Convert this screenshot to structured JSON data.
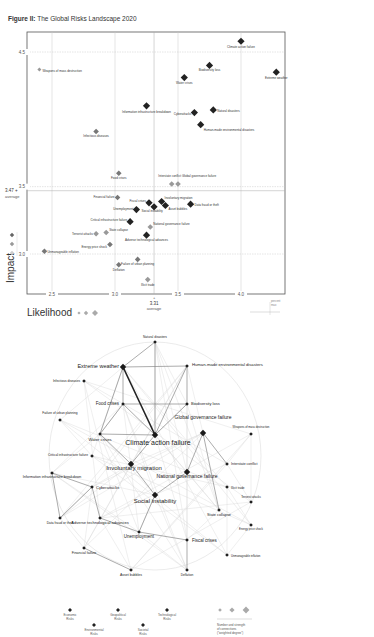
{
  "figure_title_prefix": "Figure II:",
  "figure_title": "The Global Risks Landscape 2020",
  "chart_data": [
    {
      "type": "scatter",
      "title": "The Global Risks Landscape 2020",
      "xlabel": "Likelihood",
      "ylabel": "Impact",
      "xlim": [
        2.3,
        4.3
      ],
      "ylim": [
        2.7,
        4.7
      ],
      "xticks": [
        "2.5",
        "3.0",
        "3.5",
        "4.0"
      ],
      "yticks": [
        "3.0",
        "3.5",
        "4.5"
      ],
      "x_average": {
        "value": 3.31,
        "label": "3.31",
        "caption": "average"
      },
      "y_average": {
        "value": 3.47,
        "label": "3.47",
        "caption": "average"
      },
      "grid": true,
      "points": [
        {
          "name": "Climate action failure",
          "x": 4.0,
          "y": 4.58,
          "category": "environmental",
          "size": 3
        },
        {
          "name": "Extreme weather",
          "x": 4.28,
          "y": 4.35,
          "category": "environmental",
          "size": 3
        },
        {
          "name": "Biodiversity loss",
          "x": 3.75,
          "y": 4.4,
          "category": "environmental",
          "size": 3
        },
        {
          "name": "Water crises",
          "x": 3.55,
          "y": 4.31,
          "category": "societal",
          "size": 3
        },
        {
          "name": "Weapons of mass destruction",
          "x": 2.4,
          "y": 4.37,
          "category": "geopolitical",
          "size": 1
        },
        {
          "name": "Information infrastructure breakdown",
          "x": 3.25,
          "y": 4.1,
          "category": "technological",
          "size": 3
        },
        {
          "name": "Natural disasters",
          "x": 3.78,
          "y": 4.07,
          "category": "environmental",
          "size": 3
        },
        {
          "name": "Cyberattacks",
          "x": 3.63,
          "y": 4.05,
          "category": "technological",
          "size": 3
        },
        {
          "name": "Human-made environmental disasters",
          "x": 3.68,
          "y": 3.96,
          "category": "environmental",
          "size": 3
        },
        {
          "name": "Infectious diseases",
          "x": 2.85,
          "y": 3.91,
          "category": "societal",
          "size": 2
        },
        {
          "name": "Food crises",
          "x": 3.03,
          "y": 3.6,
          "category": "societal",
          "size": 2
        },
        {
          "name": "Interstate conflict",
          "x": 3.45,
          "y": 3.52,
          "category": "geopolitical",
          "size": 2
        },
        {
          "name": "Global governance failure",
          "x": 3.5,
          "y": 3.52,
          "category": "geopolitical",
          "size": 2
        },
        {
          "name": "Financial failure",
          "x": 3.02,
          "y": 3.42,
          "category": "economic",
          "size": 2
        },
        {
          "name": "Fiscal crises",
          "x": 3.27,
          "y": 3.38,
          "category": "economic",
          "size": 3
        },
        {
          "name": "Involuntary migration",
          "x": 3.37,
          "y": 3.39,
          "category": "societal",
          "size": 3
        },
        {
          "name": "Asset bubbles",
          "x": 3.4,
          "y": 3.36,
          "category": "economic",
          "size": 3
        },
        {
          "name": "Data fraud or theft",
          "x": 3.6,
          "y": 3.37,
          "category": "technological",
          "size": 3
        },
        {
          "name": "Unemployment",
          "x": 3.17,
          "y": 3.33,
          "category": "economic",
          "size": 3
        },
        {
          "name": "Social instability",
          "x": 3.31,
          "y": 3.35,
          "category": "societal",
          "size": 3
        },
        {
          "name": "Critical infrastructure failure",
          "x": 3.12,
          "y": 3.24,
          "category": "technological",
          "size": 3
        },
        {
          "name": "National governance failure",
          "x": 3.28,
          "y": 3.2,
          "category": "geopolitical",
          "size": 2
        },
        {
          "name": "State collapse",
          "x": 2.93,
          "y": 3.16,
          "category": "geopolitical",
          "size": 2
        },
        {
          "name": "Terrorist attacks",
          "x": 2.85,
          "y": 3.15,
          "category": "geopolitical",
          "size": 2
        },
        {
          "name": "Adverse technological advances",
          "x": 3.25,
          "y": 3.14,
          "category": "technological",
          "size": 3
        },
        {
          "name": "Energy price shock",
          "x": 2.96,
          "y": 3.07,
          "category": "economic",
          "size": 2
        },
        {
          "name": "Unmanageable inflation",
          "x": 2.44,
          "y": 3.02,
          "category": "economic",
          "size": 2
        },
        {
          "name": "Failure of urban planning",
          "x": 3.18,
          "y": 2.96,
          "category": "societal",
          "size": 2
        },
        {
          "name": "Deflation",
          "x": 3.03,
          "y": 2.92,
          "category": "economic",
          "size": 2
        },
        {
          "name": "Illicit trade",
          "x": 3.26,
          "y": 2.81,
          "category": "geopolitical",
          "size": 2
        }
      ]
    },
    {
      "type": "network",
      "title": "Global Risks Interconnections",
      "nodes": [
        {
          "name": "Natural disasters"
        },
        {
          "name": "Extreme weather"
        },
        {
          "name": "Human-made environmental disasters"
        },
        {
          "name": "Infectious diseases"
        },
        {
          "name": "Food crises"
        },
        {
          "name": "Biodiversity loss"
        },
        {
          "name": "Failure of urban planning"
        },
        {
          "name": "Global governance failure"
        },
        {
          "name": "Weapons of mass destruction"
        },
        {
          "name": "Water crises"
        },
        {
          "name": "Climate action failure"
        },
        {
          "name": "Critical infrastructure failure"
        },
        {
          "name": "Involuntary migration"
        },
        {
          "name": "Interstate conflict"
        },
        {
          "name": "Information infrastructure breakdown"
        },
        {
          "name": "National governance failure"
        },
        {
          "name": "Illicit trade"
        },
        {
          "name": "Cyberattacks"
        },
        {
          "name": "Terrorist attacks"
        },
        {
          "name": "Social instability"
        },
        {
          "name": "State collapse"
        },
        {
          "name": "Energy price shock"
        },
        {
          "name": "Data fraud or theft"
        },
        {
          "name": "Adverse technological advances"
        },
        {
          "name": "Unemployment"
        },
        {
          "name": "Fiscal crises"
        },
        {
          "name": "Unmanageable inflation"
        },
        {
          "name": "Financial failure"
        },
        {
          "name": "Asset bubbles"
        },
        {
          "name": "Deflation"
        }
      ]
    }
  ],
  "axis": {
    "y_title": "Impact",
    "x_title": "Likelihood",
    "x_ticks": [
      "2.5",
      "3.0",
      "3.5",
      "4.0"
    ],
    "y_ticks": [
      "4.5",
      "3.5",
      "3.0"
    ],
    "x_avg_value": "3.31",
    "x_avg_caption": "average",
    "y_avg_value": "3.47",
    "y_avg_caption": "average",
    "corner_caption_1": "percent",
    "corner_caption_2": "max"
  },
  "legend": {
    "categories": [
      {
        "line1": "Economic",
        "line2": "Risks",
        "color": "#222222"
      },
      {
        "line1": "Environmental",
        "line2": "Risks",
        "color": "#222222"
      },
      {
        "line1": "Geopolitical",
        "line2": "Risks",
        "color": "#222222"
      },
      {
        "line1": "Societal",
        "line2": "Risks",
        "color": "#222222"
      },
      {
        "line1": "Technological",
        "line2": "Risks",
        "color": "#222222"
      }
    ],
    "strength_line1": "Number and strength",
    "strength_line2": "of connections",
    "strength_line3": "(\"weighted degree\")"
  },
  "colors": {
    "dark": "#222222",
    "mid": "#888888",
    "light": "#bbbbbb",
    "grid": "#c8c8c8",
    "edge": "#d6d6d6"
  }
}
